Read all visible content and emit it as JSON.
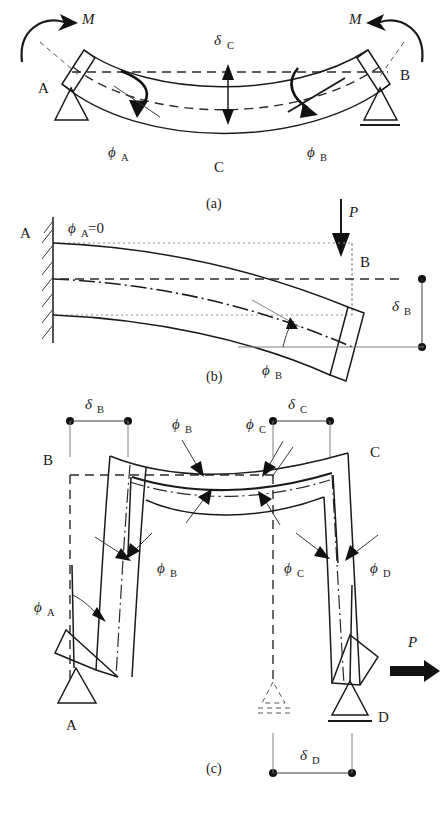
{
  "figure": {
    "background": "#ffffff",
    "line_color": "#1a1a1a"
  },
  "panel_a": {
    "caption": "(a)",
    "description": "Simply supported beam with end moments M applied at both ends",
    "moment_left": "M",
    "moment_right": "M",
    "node_a": "A",
    "node_b": "B",
    "node_c": "C",
    "deflection_c": "δ",
    "deflection_c_sub": "C",
    "rotation_a": "ϕ",
    "rotation_a_sub": "A",
    "rotation_b": "ϕ",
    "rotation_b_sub": "B",
    "support_left": "pin-support",
    "support_right": "roller-support"
  },
  "panel_b": {
    "caption": "(b)",
    "description": "Cantilever beam fixed at A with point load P at free end B",
    "node_a": "A",
    "node_b": "B",
    "load": "P",
    "rotation_a_label": "ϕ",
    "rotation_a_sub": "A",
    "rotation_a_value": "=0",
    "rotation_b": "ϕ",
    "rotation_b_sub": "B",
    "deflection_b": "δ",
    "deflection_b_sub": "B",
    "support_left": "fixed-support"
  },
  "panel_c": {
    "caption": "(c)",
    "description": "Portal frame ABCD with horizontal load P at D, sway deformation",
    "node_a": "A",
    "node_b": "B",
    "node_c": "C",
    "node_d": "D",
    "load": "P",
    "deflection_b": "δ",
    "deflection_b_sub": "B",
    "deflection_c": "δ",
    "deflection_c_sub": "C",
    "deflection_d": "δ",
    "deflection_d_sub": "D",
    "rotation_a": "ϕ",
    "rotation_a_sub": "A",
    "rotation_b_top": "ϕ",
    "rotation_b_top_sub": "B",
    "rotation_b_low": "ϕ",
    "rotation_b_low_sub": "B",
    "rotation_c_top": "ϕ",
    "rotation_c_top_sub": "C",
    "rotation_c_low": "ϕ",
    "rotation_c_low_sub": "C",
    "rotation_d": "ϕ",
    "rotation_d_sub": "D",
    "support_left": "pin-support",
    "support_right": "roller-support",
    "support_ghost": "original-roller-position"
  }
}
